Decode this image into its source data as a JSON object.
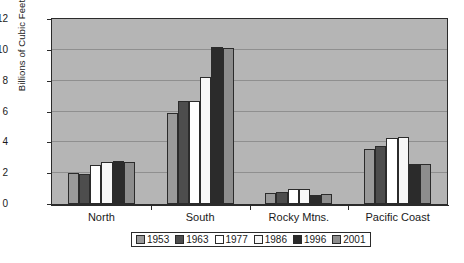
{
  "chart_data": {
    "type": "bar",
    "title": "",
    "xlabel": "",
    "ylabel": "Billions of Cubic Feet",
    "ylim": [
      0,
      12
    ],
    "ytick_step": 2,
    "yticks": [
      "0",
      "2",
      "4",
      "6",
      "8",
      "10",
      "12"
    ],
    "grid": true,
    "legend_position": "bottom",
    "categories": [
      "North",
      "South",
      "Rocky Mtns.",
      "Pacific Coast"
    ],
    "series": [
      {
        "name": "1953",
        "color": "#9a9a9a",
        "values": [
          2.0,
          5.9,
          0.7,
          3.6
        ]
      },
      {
        "name": "1963",
        "color": "#4d4d4d",
        "values": [
          1.95,
          6.7,
          0.8,
          3.75
        ]
      },
      {
        "name": "1977",
        "color": "#ffffff",
        "values": [
          2.5,
          6.7,
          1.0,
          4.3
        ]
      },
      {
        "name": "1986",
        "color": "#f7f7f7",
        "values": [
          2.75,
          8.25,
          1.0,
          4.35
        ]
      },
      {
        "name": "1996",
        "color": "#2b2b2b",
        "values": [
          2.8,
          10.2,
          0.6,
          2.6
        ]
      },
      {
        "name": "2001",
        "color": "#8d8d8d",
        "values": [
          2.75,
          10.15,
          0.65,
          2.6
        ]
      }
    ]
  },
  "plot": {
    "background_color": "#b5b5b5",
    "border_color": "#2b2b2b",
    "gridline_color": "#8f8f8f"
  }
}
